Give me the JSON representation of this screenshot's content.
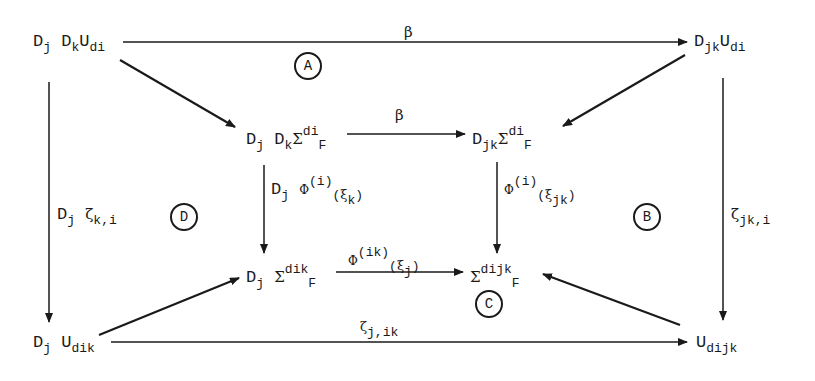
{
  "diagram": {
    "type": "commutative-diagram",
    "nodes": {
      "top_left": {
        "base": "D",
        "s1": "j",
        "base2": "D",
        "s2": "k",
        "base3": "U",
        "s3": "di"
      },
      "top_right": {
        "base": "D",
        "s1": "jk",
        "base2": "U",
        "s2": "di"
      },
      "inner_tl": {
        "base": "D",
        "s1": "j",
        "base2": "D",
        "s2": "k",
        "sigma": "Σ",
        "sup": "di",
        "tail": "F"
      },
      "inner_tr": {
        "base": "D",
        "s1": "jk",
        "sigma": "Σ",
        "sup": "di",
        "tail": "F"
      },
      "inner_bl": {
        "base": "D",
        "s1": "j",
        "sigma": "Σ",
        "sup": "dik",
        "tail": "F"
      },
      "inner_br": {
        "sigma": "Σ",
        "sup": "dijk",
        "tail": "F"
      },
      "bottom_left": {
        "base": "D",
        "s1": "j",
        "base2": "U",
        "s2": "dik"
      },
      "bottom_right": {
        "base": "U",
        "s1": "dijk"
      }
    },
    "arrow_labels": {
      "top": "β",
      "inner_top": "β",
      "left": {
        "pre": "D",
        "sub": "j",
        "greek": "ζ",
        "sub2": "k,i"
      },
      "right": {
        "greek": "ζ",
        "sub": "jk,i"
      },
      "inner_left": {
        "pre": "D",
        "sub": "j",
        "phi": "Φ",
        "sup": "(i)",
        "paren_open": "(",
        "xi": "ξ",
        "xisub": "k",
        "paren_close": ")"
      },
      "inner_right": {
        "phi": "Φ",
        "sup": "(i)",
        "paren_open": "(",
        "xi": "ξ",
        "xisub": "jk",
        "paren_close": ")"
      },
      "inner_bottom": {
        "phi": "Φ",
        "sup": "(ik)",
        "paren_open": "(",
        "xi": "ξ",
        "xisub": "j",
        "paren_close": ")"
      },
      "bottom": {
        "greek": "ζ",
        "sub": "j,ik"
      }
    },
    "regions": [
      "A",
      "B",
      "C",
      "D"
    ]
  }
}
